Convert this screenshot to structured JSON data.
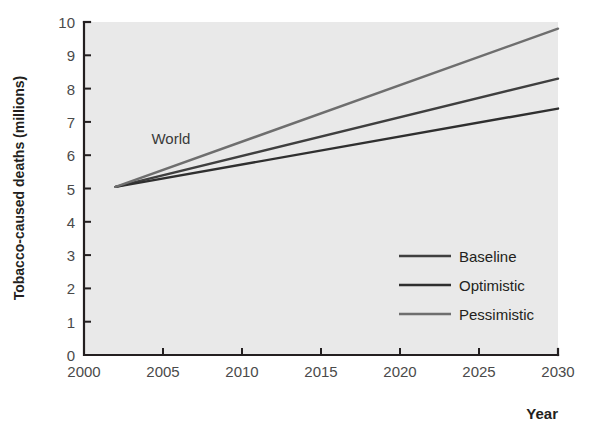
{
  "chart_data": {
    "type": "line",
    "title": "",
    "xlabel": "Year",
    "ylabel": "Tobacco-caused deaths (millions)",
    "xlim": [
      2000,
      2030
    ],
    "ylim": [
      0,
      10
    ],
    "xticks": [
      "2000",
      "2005",
      "2010",
      "2015",
      "2020",
      "2025",
      "2030"
    ],
    "yticks": [
      "0",
      "1",
      "2",
      "3",
      "4",
      "5",
      "6",
      "7",
      "8",
      "9",
      "10"
    ],
    "grid": false,
    "legend_position": "inside-lower-right",
    "annotations": [
      {
        "text": "World",
        "x": 2005.5,
        "y": 6.35
      }
    ],
    "x": [
      2002,
      2030
    ],
    "series": [
      {
        "name": "Baseline",
        "color": "#3f3f3f",
        "width": 2.4,
        "values": [
          5.05,
          8.3
        ]
      },
      {
        "name": "Optimistic",
        "color": "#2f2f2f",
        "width": 2.4,
        "values": [
          5.05,
          7.4
        ]
      },
      {
        "name": "Pessimistic",
        "color": "#6e6e6e",
        "width": 2.4,
        "values": [
          5.05,
          9.8
        ]
      }
    ]
  },
  "legend": {
    "items": [
      {
        "label": "Baseline",
        "color": "#3f3f3f"
      },
      {
        "label": "Optimistic",
        "color": "#2f2f2f"
      },
      {
        "label": "Pessimistic",
        "color": "#6e6e6e"
      }
    ]
  },
  "colors": {
    "plot_background": "#e9e9e9",
    "axis": "#231f20",
    "tick_label": "#4a4a4a"
  }
}
